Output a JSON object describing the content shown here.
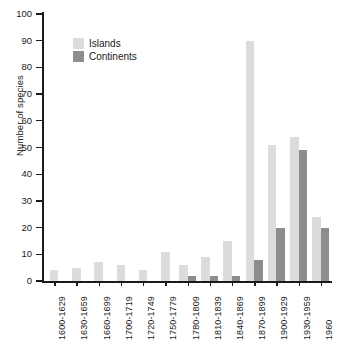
{
  "chart_data": {
    "type": "bar",
    "title": "",
    "xlabel": "",
    "ylabel": "Number of species",
    "ylim": [
      0,
      100
    ],
    "ytick_values": [
      0,
      10,
      20,
      30,
      40,
      50,
      60,
      70,
      80,
      90,
      100
    ],
    "ytick_labels": [
      "0",
      "10",
      "20",
      "30",
      "40",
      "50",
      "60",
      "70",
      "80",
      "90",
      "100"
    ],
    "grid": false,
    "legend_position": "upper-left-inside",
    "categories": [
      "1600-1629",
      "1630-1659",
      "1660-1699",
      "1700-1719",
      "1720-1749",
      "1750-1779",
      "1780-1809",
      "1810-1839",
      "1840-1869",
      "1870-1899",
      "1900-1929",
      "1930-1959",
      "1960"
    ],
    "series": [
      {
        "name": "Islands",
        "color": "#dcdcdc",
        "values": [
          4,
          5,
          7,
          6,
          4,
          11,
          6,
          9,
          15,
          90,
          51,
          54,
          24
        ]
      },
      {
        "name": "Continents",
        "color": "#8d8d8d",
        "values": [
          0,
          0,
          0,
          0,
          0,
          0,
          2,
          2,
          2,
          8,
          20,
          49,
          20
        ]
      }
    ]
  }
}
